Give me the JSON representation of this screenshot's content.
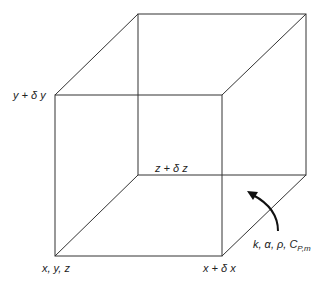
{
  "diagram": {
    "colors": {
      "line": "#333333",
      "text": "#222222",
      "background": "#ffffff"
    },
    "vertices": {
      "front_bottom_left": [
        55,
        256
      ],
      "front_bottom_right": [
        222,
        256
      ],
      "front_top_left": [
        55,
        95
      ],
      "front_top_right": [
        222,
        95
      ],
      "back_bottom_left": [
        138,
        175
      ],
      "back_bottom_right": [
        306,
        175
      ],
      "back_top_left": [
        138,
        14
      ],
      "back_top_right": [
        306,
        14
      ]
    },
    "labels": {
      "origin": "x, y, z",
      "x_plus": "x + δ x",
      "y_plus": "y + δ y",
      "z_plus": "z + δ z",
      "properties_main": "k, α, ρ, C",
      "properties_sub": "P,m"
    },
    "arrow": {
      "description": "curved arrow pointing into cube from properties label",
      "icon": "curved-arrow-icon"
    }
  }
}
